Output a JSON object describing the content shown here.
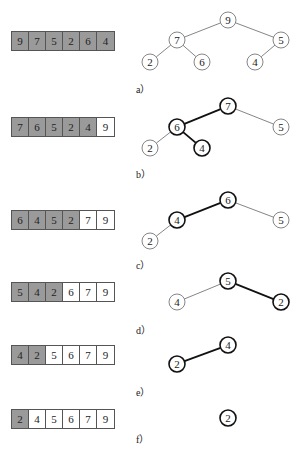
{
  "steps": [
    {
      "label": "a）",
      "array": [
        "9",
        "7",
        "5",
        "2",
        "6",
        "4"
      ],
      "heap_size": 6
    },
    {
      "label": "b）",
      "array": [
        "7",
        "6",
        "5",
        "2",
        "4",
        "9"
      ],
      "heap_size": 5
    },
    {
      "label": "c）",
      "array": [
        "6",
        "4",
        "5",
        "2",
        "7",
        "9"
      ],
      "heap_size": 4
    },
    {
      "label": "d）",
      "array": [
        "5",
        "4",
        "2",
        "6",
        "7",
        "9"
      ],
      "heap_size": 3
    },
    {
      "label": "e）",
      "array": [
        "4",
        "2",
        "5",
        "6",
        "7",
        "9"
      ],
      "heap_size": 2
    },
    {
      "label": "f）",
      "array": [
        "2",
        "4",
        "5",
        "6",
        "7",
        "9"
      ],
      "heap_size": 1
    }
  ],
  "trees": [
    {
      "nodes": [
        {
          "v": "9",
          "x": 228,
          "y": 20
        },
        {
          "v": "7",
          "x": 177,
          "y": 40
        },
        {
          "v": "5",
          "x": 281,
          "y": 40
        },
        {
          "v": "2",
          "x": 150,
          "y": 62
        },
        {
          "v": "6",
          "x": 202,
          "y": 62
        },
        {
          "v": "4",
          "x": 255,
          "y": 62
        }
      ],
      "edges": [
        [
          0,
          1
        ],
        [
          0,
          2
        ],
        [
          1,
          3
        ],
        [
          1,
          4
        ],
        [
          2,
          5
        ]
      ],
      "bold_nodes": [],
      "bold_edges": []
    },
    {
      "nodes": [
        {
          "v": "7",
          "x": 228,
          "y": 106
        },
        {
          "v": "6",
          "x": 177,
          "y": 127
        },
        {
          "v": "5",
          "x": 281,
          "y": 127
        },
        {
          "v": "2",
          "x": 150,
          "y": 148
        },
        {
          "v": "4",
          "x": 202,
          "y": 148
        }
      ],
      "edges": [
        [
          0,
          1
        ],
        [
          0,
          2
        ],
        [
          1,
          3
        ],
        [
          1,
          4
        ]
      ],
      "bold_nodes": [
        0,
        1,
        4
      ],
      "bold_edges": [
        0,
        3
      ]
    },
    {
      "nodes": [
        {
          "v": "6",
          "x": 228,
          "y": 200
        },
        {
          "v": "4",
          "x": 177,
          "y": 220
        },
        {
          "v": "5",
          "x": 281,
          "y": 220
        },
        {
          "v": "2",
          "x": 150,
          "y": 241
        }
      ],
      "edges": [
        [
          0,
          1
        ],
        [
          0,
          2
        ],
        [
          1,
          3
        ]
      ],
      "bold_nodes": [
        0,
        1
      ],
      "bold_edges": [
        0
      ]
    },
    {
      "nodes": [
        {
          "v": "5",
          "x": 228,
          "y": 281
        },
        {
          "v": "4",
          "x": 177,
          "y": 302
        },
        {
          "v": "2",
          "x": 281,
          "y": 302
        }
      ],
      "edges": [
        [
          0,
          1
        ],
        [
          0,
          2
        ]
      ],
      "bold_nodes": [
        0,
        2
      ],
      "bold_edges": [
        1
      ]
    },
    {
      "nodes": [
        {
          "v": "4",
          "x": 228,
          "y": 345
        },
        {
          "v": "2",
          "x": 177,
          "y": 364
        }
      ],
      "edges": [
        [
          0,
          1
        ]
      ],
      "bold_nodes": [
        0,
        1
      ],
      "bold_edges": [
        0
      ]
    },
    {
      "nodes": [
        {
          "v": "2",
          "x": 228,
          "y": 418
        }
      ],
      "edges": [],
      "bold_nodes": [
        0
      ],
      "bold_edges": []
    }
  ],
  "colors": {
    "heap_cell": "#9a9a9a",
    "sorted_cell": "#ffffff",
    "border": "#555555",
    "bold_stroke": "#111111",
    "thin_stroke": "#666666"
  }
}
